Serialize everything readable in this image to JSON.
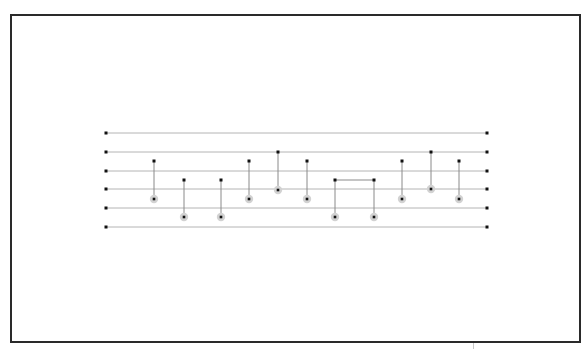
{
  "diagram": {
    "type": "circuit",
    "colors": {
      "frame": "#2a2a2a",
      "wire": "#b4b4b4",
      "endpoint": "#111111",
      "connector": "#8a8a8a",
      "target_fill": "#d2d2d2",
      "target_dot": "#111111"
    },
    "wires": {
      "x_start": 106,
      "x_end": 487,
      "y": [
        133,
        152,
        171,
        189,
        208,
        227
      ]
    },
    "gates": [
      {
        "x": 154,
        "control_y": 161,
        "target_y": 199
      },
      {
        "x": 184,
        "control_y": 180,
        "target_y": 217
      },
      {
        "x": 221,
        "control_y": 180,
        "target_y": 217
      },
      {
        "x": 249,
        "control_y": 161,
        "target_y": 199
      },
      {
        "x": 278,
        "control_y": 152,
        "target_y": 190
      },
      {
        "x": 307,
        "control_y": 161,
        "target_y": 199
      },
      {
        "x": 335,
        "control_y": 180,
        "target_y": 217
      },
      {
        "x": 374,
        "control_y": 180,
        "target_y": 217
      },
      {
        "x": 402,
        "control_y": 161,
        "target_y": 199
      },
      {
        "x": 431,
        "control_y": 152,
        "target_y": 189
      },
      {
        "x": 459,
        "control_y": 161,
        "target_y": 199
      }
    ],
    "links": [
      {
        "from_x": 335,
        "to_x": 374,
        "y": 180
      }
    ]
  }
}
